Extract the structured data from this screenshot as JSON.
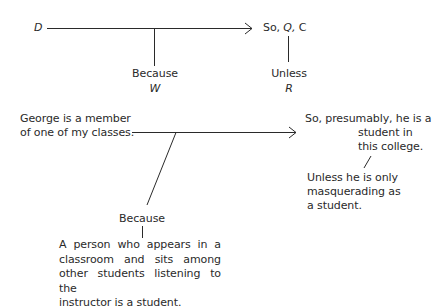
{
  "schema": {
    "data_label": "D",
    "claim_label": "So, Q, C",
    "claim_parts": {
      "so": "So,",
      "qualifier": "Q,",
      "claim": "C"
    },
    "warrant_connector": "Because",
    "warrant_label": "W",
    "rebuttal_connector": "Unless",
    "rebuttal_label": "R"
  },
  "example": {
    "data_lines": [
      "George is a member",
      "of one of my classes."
    ],
    "claim_lines": [
      "So, presumably, he is a",
      "student in",
      "this college."
    ],
    "rebuttal_lines": [
      "Unless he is only",
      "masquerading as",
      "a student."
    ],
    "warrant_connector": "Because",
    "warrant_lines": [
      "A person who appears in a",
      "classroom and sits among",
      "other students listening to the",
      "instructor is a student."
    ]
  },
  "colors": {
    "ink": "#2a2a2a",
    "background": "#ffffff"
  }
}
